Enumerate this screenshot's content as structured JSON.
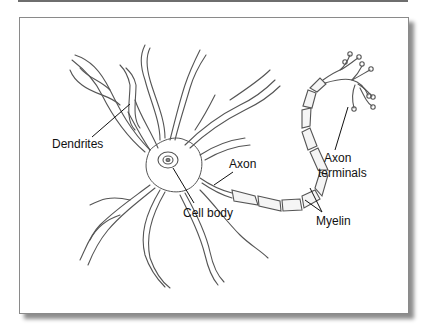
{
  "figure": {
    "labels": {
      "dendrites": "Dendrites",
      "axon": "Axon",
      "cell_body": "Cell body",
      "axon_terminals_line1": "Axon",
      "axon_terminals_line2": "terminals",
      "myelin": "Myelin"
    },
    "colors": {
      "line": "#555555",
      "frame_border": "#8a8a8a",
      "background": "#ffffff"
    }
  }
}
